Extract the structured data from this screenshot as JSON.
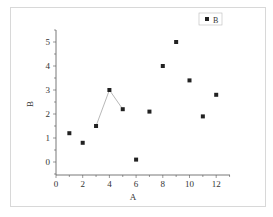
{
  "chart_data": {
    "type": "scatter",
    "title": "",
    "xlabel": "A",
    "ylabel": "B",
    "xlim": [
      0,
      13
    ],
    "ylim": [
      -0.5,
      5.5
    ],
    "x_ticks": [
      0,
      2,
      4,
      6,
      8,
      10,
      12
    ],
    "y_ticks": [
      0,
      1,
      2,
      3,
      4,
      5
    ],
    "grid": false,
    "legend_position": "top-right",
    "series": [
      {
        "name": "B",
        "marker": "square",
        "color": "#222222",
        "x": [
          1,
          2,
          3,
          4,
          5,
          6,
          7,
          8,
          9,
          10,
          11,
          12
        ],
        "y": [
          1.2,
          0.8,
          1.5,
          3.0,
          2.2,
          0.1,
          2.1,
          4.0,
          5.0,
          3.4,
          1.9,
          2.8
        ]
      }
    ],
    "connecting_line": {
      "x": [
        3,
        4,
        5
      ],
      "y": [
        1.5,
        3.0,
        2.2
      ],
      "color": "#999999"
    }
  },
  "legend": {
    "label": "B"
  },
  "axes": {
    "x_title": "A",
    "y_title": "B"
  }
}
